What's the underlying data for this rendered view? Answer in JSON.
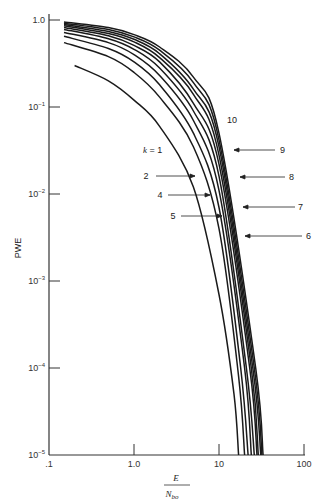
{
  "chart_data": {
    "type": "line",
    "title": "",
    "xlabel": "E / N_bo",
    "xlabel_num": "E",
    "xlabel_den": "N",
    "xlabel_den_sub": "bo",
    "ylabel": "PWE",
    "xscale": "log",
    "yscale": "log",
    "xlim": [
      0.1,
      100
    ],
    "ylim": [
      1e-05,
      1.0
    ],
    "x_ticks": [
      ".1",
      "1.0",
      "10",
      "100"
    ],
    "y_ticks": [
      {
        "base": "1.0",
        "exp": ""
      },
      {
        "base": "10",
        "exp": "−1"
      },
      {
        "base": "10",
        "exp": "−2"
      },
      {
        "base": "10",
        "exp": "−3"
      },
      {
        "base": "10",
        "exp": "−4"
      },
      {
        "base": "10",
        "exp": "−5"
      }
    ],
    "grid": false,
    "legend": "inline labels with arrows",
    "series": [
      {
        "name": "k = 1",
        "label": "k = 1",
        "x": [
          0.2,
          0.5,
          1.0,
          2.0,
          5.0,
          10,
          15,
          17
        ],
        "y": [
          0.3,
          0.2,
          0.12,
          0.06,
          0.012,
          0.0007,
          5e-05,
          1e-05
        ]
      },
      {
        "name": "k = 2",
        "label": "2",
        "x": [
          0.15,
          0.5,
          1.0,
          2.0,
          5.0,
          10,
          17,
          20
        ],
        "y": [
          0.55,
          0.38,
          0.25,
          0.13,
          0.035,
          0.004,
          8e-05,
          1e-05
        ]
      },
      {
        "name": "k = 3",
        "label": "",
        "x": [
          0.15,
          0.5,
          1.0,
          2.0,
          5.0,
          10,
          18,
          22
        ],
        "y": [
          0.65,
          0.47,
          0.33,
          0.18,
          0.05,
          0.007,
          0.0001,
          1e-05
        ]
      },
      {
        "name": "k = 4",
        "label": "4",
        "x": [
          0.15,
          0.5,
          1.0,
          2.0,
          5.0,
          10,
          20,
          24
        ],
        "y": [
          0.72,
          0.55,
          0.4,
          0.23,
          0.07,
          0.011,
          0.0001,
          1e-05
        ]
      },
      {
        "name": "k = 5",
        "label": "5",
        "x": [
          0.15,
          0.5,
          1.0,
          2.0,
          5.0,
          10,
          21,
          26
        ],
        "y": [
          0.78,
          0.61,
          0.46,
          0.28,
          0.09,
          0.016,
          0.0001,
          1e-05
        ]
      },
      {
        "name": "k = 6",
        "label": "6",
        "x": [
          0.15,
          0.5,
          1.0,
          2.0,
          5.0,
          10,
          23,
          28
        ],
        "y": [
          0.82,
          0.66,
          0.51,
          0.33,
          0.11,
          0.022,
          0.0001,
          1e-05
        ]
      },
      {
        "name": "k = 7",
        "label": "7",
        "x": [
          0.15,
          0.5,
          1.0,
          2.0,
          5.0,
          10,
          24,
          29
        ],
        "y": [
          0.86,
          0.7,
          0.56,
          0.37,
          0.14,
          0.028,
          0.0001,
          1e-05
        ]
      },
      {
        "name": "k = 8",
        "label": "8",
        "x": [
          0.15,
          0.5,
          1.0,
          2.0,
          5.0,
          10,
          25,
          31
        ],
        "y": [
          0.89,
          0.74,
          0.6,
          0.41,
          0.16,
          0.035,
          0.0001,
          1e-05
        ]
      },
      {
        "name": "k = 9",
        "label": "9",
        "x": [
          0.15,
          0.5,
          1.0,
          2.0,
          5.0,
          10,
          26,
          32
        ],
        "y": [
          0.92,
          0.78,
          0.64,
          0.45,
          0.19,
          0.042,
          0.0001,
          1e-05
        ]
      },
      {
        "name": "k = 10",
        "label": "10",
        "x": [
          0.15,
          0.5,
          1.0,
          2.0,
          5.0,
          10,
          27,
          33
        ],
        "y": [
          0.95,
          0.82,
          0.68,
          0.49,
          0.22,
          0.05,
          0.0001,
          1e-05
        ]
      }
    ]
  },
  "labels": {
    "k1": "k = 1",
    "c2": "2",
    "c4": "4",
    "c5": "5",
    "c6": "6",
    "c7": "7",
    "c8": "8",
    "c9": "9",
    "c10": "10"
  }
}
